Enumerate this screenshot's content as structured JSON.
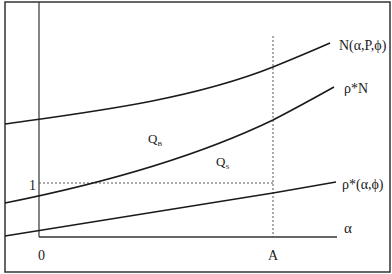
{
  "diagram": {
    "curves": [
      {
        "id": "N",
        "label": "N(α,P,ϕ)"
      },
      {
        "id": "rhoN",
        "label": "ρ*N"
      },
      {
        "id": "rho",
        "label": "ρ*(α,ϕ)"
      }
    ],
    "regions": {
      "QB": {
        "main": "Q",
        "sub": "B"
      },
      "QS": {
        "main": "Q",
        "sub": "S"
      }
    },
    "axes": {
      "x_label": "α",
      "origin_label": "0",
      "x_marker_label": "A",
      "y_marker_label": "1"
    },
    "colors": {
      "line": "#1a1a1a",
      "dashed": "#555555",
      "frame": "#333333"
    }
  }
}
